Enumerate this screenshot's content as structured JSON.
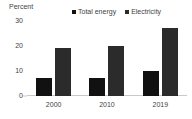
{
  "chart_data": {
    "type": "bar",
    "title": "",
    "subtitle": "",
    "xlabel": "",
    "ylabel": "Percent",
    "ylim": [
      0,
      30
    ],
    "yticks": [
      0,
      10,
      20,
      30
    ],
    "ytick_labels": [
      "0",
      "10",
      "20",
      "30"
    ],
    "grid": false,
    "legend_position": "top",
    "categories": [
      "2000",
      "2010",
      "2019"
    ],
    "series": [
      {
        "name": "Total energy",
        "color": "#111111",
        "values": [
          7,
          7,
          10
        ]
      },
      {
        "name": "Electricity",
        "color": "#2b2b2b",
        "values": [
          19,
          20,
          27
        ]
      }
    ]
  },
  "legend": {
    "items": [
      {
        "label": "Total energy",
        "marker": "square-marker-icon"
      },
      {
        "label": "Electricity",
        "marker": "square-marker-icon"
      }
    ]
  },
  "axes": {
    "y_title": "Percent"
  }
}
